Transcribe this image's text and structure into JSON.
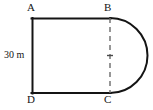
{
  "figure": {
    "background_color": "#ffffff",
    "stroke_color": "#141414",
    "dashed_stroke_color": "#6b6b6b"
  },
  "labels": {
    "vertex_a": "A",
    "vertex_b": "B",
    "vertex_c": "C",
    "vertex_d": "D",
    "dimension_left": "30 m"
  },
  "geometry": {
    "rectangle": {
      "left": 32,
      "top": 18,
      "right": 110,
      "bottom": 93,
      "width": 78,
      "height": 75
    },
    "semicircle": {
      "center_x": 110,
      "center_y": 55.5,
      "radius": 37.5,
      "rightmost_x": 145.5,
      "side": "right"
    },
    "dashed_segment": {
      "x": 110,
      "y_start": 18,
      "y_end": 93
    },
    "midpoint_tick": {
      "x": 110,
      "y": 55.5,
      "half_width": 3
    }
  }
}
